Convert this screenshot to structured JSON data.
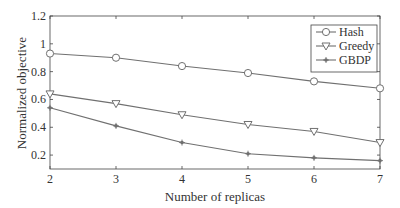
{
  "chart_data": {
    "type": "line",
    "title": "",
    "xlabel": "Number of replicas",
    "ylabel": "Normalized objective",
    "x": [
      2,
      3,
      4,
      5,
      6,
      7
    ],
    "xlim": [
      2,
      7
    ],
    "ylim": [
      0.1,
      1.2
    ],
    "xticks": [
      "2",
      "3",
      "4",
      "5",
      "6",
      "7"
    ],
    "yticks": [
      "0.2",
      "0.4",
      "0.6",
      "0.8",
      "1",
      "1.2"
    ],
    "grid": false,
    "legend_position": "upper right",
    "series": [
      {
        "name": "Hash",
        "marker": "circle",
        "values": [
          0.93,
          0.9,
          0.84,
          0.79,
          0.73,
          0.68
        ]
      },
      {
        "name": "Greedy",
        "marker": "triangle-down",
        "values": [
          0.64,
          0.57,
          0.49,
          0.42,
          0.37,
          0.29
        ]
      },
      {
        "name": "GBDP",
        "marker": "asterisk",
        "values": [
          0.54,
          0.41,
          0.29,
          0.21,
          0.18,
          0.16
        ]
      }
    ]
  },
  "colors": {
    "line": "#707070",
    "axis": "#444444"
  }
}
